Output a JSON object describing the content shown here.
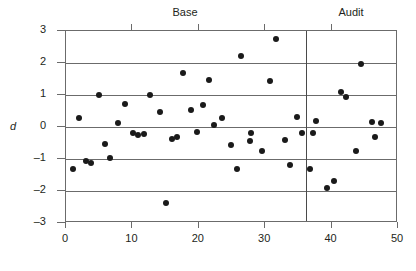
{
  "chart_data": {
    "type": "scatter",
    "title": "",
    "xlabel": "",
    "ylabel": "d",
    "xlim": [
      0,
      50
    ],
    "ylim": [
      -3,
      3
    ],
    "xticks": [
      0,
      10,
      20,
      30,
      40,
      50
    ],
    "yticks": [
      3,
      2,
      1,
      0,
      -1,
      -2,
      -3
    ],
    "grid": true,
    "grid_axis": "y",
    "legend": "none",
    "annotations": [
      {
        "label": "Base",
        "x_center": 18,
        "kind": "group-heading"
      },
      {
        "label": "Audit",
        "x_center": 43,
        "kind": "group-heading"
      }
    ],
    "dividers": [
      {
        "x": 36.2,
        "orientation": "vertical"
      }
    ],
    "series": [
      {
        "name": "d",
        "marker": "filled-circle",
        "color": "#1a1a1a",
        "points": [
          {
            "x": 1.1,
            "y": -1.3
          },
          {
            "x": 1.9,
            "y": 0.27
          },
          {
            "x": 3.0,
            "y": -1.07
          },
          {
            "x": 3.8,
            "y": -1.12
          },
          {
            "x": 5.0,
            "y": 1.0
          },
          {
            "x": 5.8,
            "y": -0.53
          },
          {
            "x": 6.7,
            "y": -0.98
          },
          {
            "x": 7.9,
            "y": 0.12
          },
          {
            "x": 8.9,
            "y": 0.72
          },
          {
            "x": 10.1,
            "y": -0.19
          },
          {
            "x": 10.8,
            "y": -0.25
          },
          {
            "x": 11.8,
            "y": -0.21
          },
          {
            "x": 12.7,
            "y": 1.0
          },
          {
            "x": 14.1,
            "y": 0.47
          },
          {
            "x": 15.0,
            "y": -2.36
          },
          {
            "x": 16.0,
            "y": -0.38
          },
          {
            "x": 16.7,
            "y": -0.31
          },
          {
            "x": 17.6,
            "y": 1.68
          },
          {
            "x": 18.8,
            "y": 0.52
          },
          {
            "x": 19.8,
            "y": -0.15
          },
          {
            "x": 20.7,
            "y": 0.7
          },
          {
            "x": 21.5,
            "y": 1.46
          },
          {
            "x": 22.3,
            "y": 0.07
          },
          {
            "x": 23.5,
            "y": 0.27
          },
          {
            "x": 24.8,
            "y": -0.55
          },
          {
            "x": 25.8,
            "y": -1.32
          },
          {
            "x": 26.3,
            "y": 2.21
          },
          {
            "x": 27.7,
            "y": -0.45
          },
          {
            "x": 27.9,
            "y": -0.19
          },
          {
            "x": 29.5,
            "y": -0.76
          },
          {
            "x": 30.7,
            "y": 1.45
          },
          {
            "x": 31.6,
            "y": 2.76
          },
          {
            "x": 33.0,
            "y": -0.42
          },
          {
            "x": 33.8,
            "y": -1.19
          },
          {
            "x": 34.8,
            "y": 0.32
          },
          {
            "x": 35.5,
            "y": -0.19
          },
          {
            "x": 36.7,
            "y": -1.32
          },
          {
            "x": 37.2,
            "y": -0.2
          },
          {
            "x": 37.7,
            "y": 0.2
          },
          {
            "x": 39.3,
            "y": -1.91
          },
          {
            "x": 40.3,
            "y": -1.68
          },
          {
            "x": 41.4,
            "y": 1.1
          },
          {
            "x": 42.1,
            "y": 0.93
          },
          {
            "x": 43.6,
            "y": -0.74
          },
          {
            "x": 44.5,
            "y": 1.97
          },
          {
            "x": 46.1,
            "y": 0.16
          },
          {
            "x": 46.5,
            "y": -0.32
          },
          {
            "x": 47.5,
            "y": 0.14
          }
        ]
      }
    ]
  },
  "axes": {
    "y_title": "d",
    "y_tick_labels": [
      "3",
      "2",
      "1",
      "0",
      "–1",
      "–2",
      "–3"
    ],
    "x_tick_labels": [
      "0",
      "10",
      "20",
      "30",
      "40",
      "50"
    ]
  },
  "groups": {
    "base_label": "Base",
    "audit_label": "Audit"
  },
  "colors": {
    "marker": "#1a1a1a",
    "grid": "#6b6b6b",
    "divider": "#4a4a4a",
    "text": "#231f20"
  }
}
